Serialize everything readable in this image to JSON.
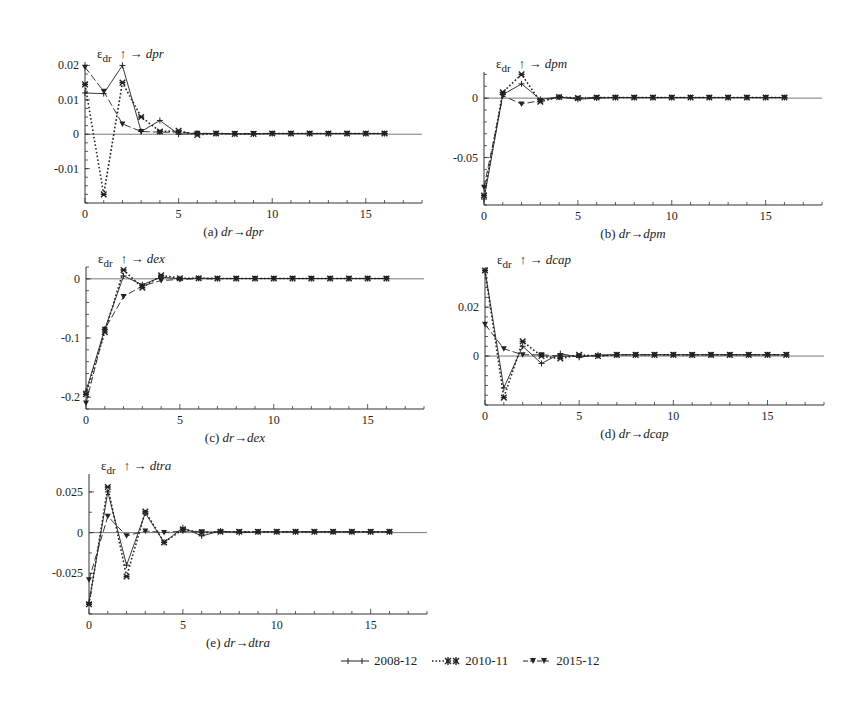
{
  "chart_data": [
    {
      "id": "a",
      "type": "line",
      "title": "ε_dr ↑ → dpr",
      "title_target": "dpr",
      "caption_prefix": "(a)",
      "caption_from": "dr",
      "caption_to": "dpr",
      "xlabel": "",
      "ylabel": "ε_dr",
      "xlim": [
        0,
        18
      ],
      "ylim": [
        -0.02,
        0.021
      ],
      "x_ticks": [
        0,
        5,
        10,
        15
      ],
      "y_ticks": [
        -0.01,
        0,
        0.01,
        0.02
      ],
      "y_tick_labels": [
        "-0.01",
        "0",
        "0.01",
        "0.02"
      ],
      "y_minor_step": 0.0025,
      "x": [
        0,
        1,
        2,
        3,
        4,
        5,
        6,
        7,
        8,
        9,
        10,
        11,
        12,
        13,
        14,
        15,
        16
      ],
      "series": [
        {
          "name": "2008-12",
          "values": [
            0.012,
            0.0118,
            0.02,
            0.0008,
            0.004,
            0.0,
            0.0002,
            0.0002,
            0.0001,
            0.0001,
            0.0002,
            0.0002,
            0.0002,
            0.0002,
            0.0002,
            0.0002,
            0.0002
          ]
        },
        {
          "name": "2010-11",
          "values": [
            0.0145,
            -0.0175,
            0.015,
            0.005,
            0.0008,
            0.001,
            -0.0002,
            0.0002,
            0.0001,
            0.0001,
            0.0002,
            0.0002,
            0.0002,
            0.0002,
            0.0002,
            0.0002,
            0.0002
          ]
        },
        {
          "name": "2015-12",
          "values": [
            0.0195,
            0.0125,
            0.003,
            0.0008,
            0.0006,
            0.0006,
            0.0003,
            0.0002,
            0.0002,
            0.0002,
            0.0002,
            0.0002,
            0.0002,
            0.0002,
            0.0002,
            0.0002,
            0.0002
          ]
        }
      ],
      "box": {
        "left": 85,
        "right": 422,
        "top": 62,
        "bottom": 203
      }
    },
    {
      "id": "b",
      "type": "line",
      "title": "ε_dr ↑ → dpm",
      "title_target": "dpm",
      "caption_prefix": "(b)",
      "caption_from": "dr",
      "caption_to": "dpm",
      "xlabel": "",
      "ylabel": "ε_dr",
      "xlim": [
        0,
        18
      ],
      "ylim": [
        -0.09,
        0.022
      ],
      "x_ticks": [
        0,
        5,
        10,
        15
      ],
      "y_ticks": [
        -0.05,
        0
      ],
      "y_tick_labels": [
        "-0.05",
        "0"
      ],
      "y_minor_step": 0.01,
      "x": [
        0,
        1,
        2,
        3,
        4,
        5,
        6,
        7,
        8,
        9,
        10,
        11,
        12,
        13,
        14,
        15,
        16
      ],
      "series": [
        {
          "name": "2008-12",
          "values": [
            -0.085,
            0.003,
            0.012,
            -0.001,
            0.001,
            -0.001,
            0.0,
            0.0005,
            0.0005,
            0.0005,
            0.0005,
            0.0005,
            0.0005,
            0.0005,
            0.0005,
            0.0005,
            0.0005
          ]
        },
        {
          "name": "2010-11",
          "values": [
            -0.082,
            0.005,
            0.02,
            -0.003,
            0.001,
            0.0,
            0.0005,
            0.0005,
            0.0005,
            0.0005,
            0.0005,
            0.0005,
            0.0005,
            0.0005,
            0.0005,
            0.0005,
            0.0005
          ]
        },
        {
          "name": "2015-12",
          "values": [
            -0.075,
            0.002,
            -0.005,
            -0.002,
            0.0005,
            0.0,
            0.0005,
            0.0005,
            0.0005,
            0.0005,
            0.0005,
            0.0005,
            0.0005,
            0.0005,
            0.0005,
            0.0005,
            0.0005
          ]
        }
      ],
      "box": {
        "left": 484,
        "right": 822,
        "top": 72,
        "bottom": 205
      }
    },
    {
      "id": "c",
      "type": "line",
      "title": "ε_dr ↑ → dex",
      "title_target": "dex",
      "caption_prefix": "(c)",
      "caption_from": "dr",
      "caption_to": "dex",
      "xlabel": "",
      "ylabel": "ε_dr",
      "xlim": [
        0,
        18
      ],
      "ylim": [
        -0.22,
        0.02
      ],
      "x_ticks": [
        0,
        5,
        10,
        15
      ],
      "y_ticks": [
        -0.2,
        -0.1,
        0
      ],
      "y_tick_labels": [
        "-0.2",
        "-0.1",
        "0"
      ],
      "y_minor_step": 0.02,
      "x": [
        0,
        1,
        2,
        3,
        4,
        5,
        6,
        7,
        8,
        9,
        10,
        11,
        12,
        13,
        14,
        15,
        16
      ],
      "series": [
        {
          "name": "2008-12",
          "values": [
            -0.19,
            -0.085,
            0.005,
            -0.01,
            0.003,
            0.0,
            0.001,
            0.0005,
            0.0005,
            0.0005,
            0.0005,
            0.0005,
            0.0005,
            0.0005,
            0.0005,
            0.0005,
            0.0005
          ]
        },
        {
          "name": "2010-11",
          "values": [
            -0.195,
            -0.09,
            0.015,
            -0.015,
            0.006,
            0.001,
            0.001,
            0.0005,
            0.0005,
            0.0005,
            0.0005,
            0.0005,
            0.0005,
            0.0005,
            0.0005,
            0.0005,
            0.0005
          ]
        },
        {
          "name": "2015-12",
          "values": [
            -0.21,
            -0.085,
            -0.03,
            -0.012,
            -0.003,
            -0.001,
            0.0,
            0.0,
            0.0005,
            0.0005,
            0.0005,
            0.0005,
            0.0005,
            0.0005,
            0.0005,
            0.0005,
            0.0005
          ]
        }
      ],
      "box": {
        "left": 86,
        "right": 424,
        "top": 267,
        "bottom": 409
      }
    },
    {
      "id": "d",
      "type": "line",
      "title": "ε_dr ↑ → dcap",
      "title_target": "dcap",
      "caption_prefix": "(d)",
      "caption_from": "dr",
      "caption_to": "dcap",
      "xlabel": "",
      "ylabel": "ε_dr",
      "xlim": [
        0,
        18
      ],
      "ylim": [
        -0.02,
        0.036
      ],
      "x_ticks": [
        0,
        5,
        10,
        15
      ],
      "y_ticks": [
        0,
        0.02
      ],
      "y_tick_labels": [
        "0",
        "0.02"
      ],
      "y_minor_step": 0.004,
      "x": [
        0,
        1,
        2,
        3,
        4,
        5,
        6,
        7,
        8,
        9,
        10,
        11,
        12,
        13,
        14,
        15,
        16
      ],
      "series": [
        {
          "name": "2008-12",
          "values": [
            0.035,
            -0.013,
            0.004,
            -0.003,
            0.001,
            -0.0005,
            0.0005,
            0.0005,
            0.0005,
            0.0005,
            0.0005,
            0.0005,
            0.0005,
            0.0005,
            0.0005,
            0.0005,
            0.0005
          ]
        },
        {
          "name": "2010-11",
          "values": [
            0.035,
            -0.017,
            0.006,
            0.0,
            -0.001,
            0.0005,
            0.0,
            0.0005,
            0.0005,
            0.0005,
            0.0005,
            0.0005,
            0.0005,
            0.0005,
            0.0005,
            0.0005,
            0.0005
          ]
        },
        {
          "name": "2015-12",
          "values": [
            0.013,
            0.003,
            0.0005,
            0.0005,
            0.0,
            0.0,
            0.0,
            0.0005,
            0.0005,
            0.0005,
            0.0005,
            0.0005,
            0.0005,
            0.0005,
            0.0005,
            0.0005,
            0.0005
          ]
        }
      ],
      "box": {
        "left": 485,
        "right": 824,
        "top": 268,
        "bottom": 405
      }
    },
    {
      "id": "e",
      "type": "line",
      "title": "ε_dr ↑ → dtra",
      "title_target": "dtra",
      "caption_prefix": "(e)",
      "caption_from": "dr",
      "caption_to": "dtra",
      "xlabel": "",
      "ylabel": "ε_dr",
      "xlim": [
        0,
        18
      ],
      "ylim": [
        -0.05,
        0.036
      ],
      "x_ticks": [
        0,
        5,
        10,
        15
      ],
      "y_ticks": [
        -0.025,
        0,
        0.025
      ],
      "y_tick_labels": [
        "-0.025",
        "0",
        "0.025"
      ],
      "y_minor_step": 0.0125,
      "x": [
        0,
        1,
        2,
        3,
        4,
        5,
        6,
        7,
        8,
        9,
        10,
        11,
        12,
        13,
        14,
        15,
        16
      ],
      "series": [
        {
          "name": "2008-12",
          "values": [
            -0.043,
            0.025,
            -0.02,
            0.012,
            -0.006,
            0.003,
            -0.002,
            0.001,
            0.0,
            0.0005,
            0.0005,
            0.0005,
            0.0005,
            0.0005,
            0.0005,
            0.0005,
            0.0005
          ]
        },
        {
          "name": "2010-11",
          "values": [
            -0.044,
            0.028,
            -0.027,
            0.013,
            -0.006,
            0.002,
            0.0,
            0.0005,
            0.0005,
            0.0005,
            0.0005,
            0.0005,
            0.0005,
            0.0005,
            0.0005,
            0.0005,
            0.0005
          ]
        },
        {
          "name": "2015-12",
          "values": [
            -0.029,
            0.01,
            -0.002,
            0.001,
            0.0,
            0.001,
            0.0005,
            0.0005,
            0.0005,
            0.0005,
            0.0005,
            0.0005,
            0.0005,
            0.0005,
            0.0005,
            0.0005,
            0.0005
          ]
        }
      ],
      "box": {
        "left": 89,
        "right": 427,
        "top": 474,
        "bottom": 614
      }
    }
  ],
  "legend": {
    "position": "bottom-center",
    "items": [
      {
        "label": "2008-12",
        "marker": "plus",
        "line": "solid"
      },
      {
        "label": "2010-11",
        "marker": "x-star",
        "line": "dotted"
      },
      {
        "label": "2015-12",
        "marker": "triangle-down",
        "line": "dashed"
      }
    ]
  },
  "styles": {
    "line_color": "#222222",
    "axis_color": "#333333"
  }
}
